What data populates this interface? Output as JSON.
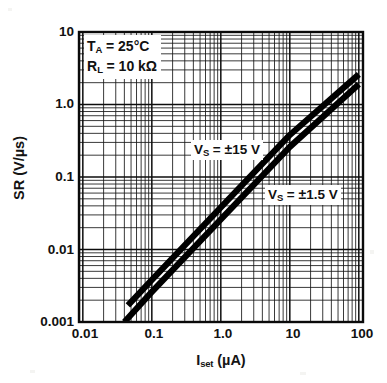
{
  "chart_data": {
    "type": "line",
    "title": "",
    "xlabel": "I_set (µA)",
    "ylabel": "SR (V/µs)",
    "xscale": "log",
    "yscale": "log",
    "xlim": [
      0.0088,
      115
    ],
    "ylim": [
      0.001,
      10
    ],
    "grid": true,
    "minor_grid": true,
    "legend_position": "inline-annotations",
    "x_ticks": [
      "0.01",
      "0.1",
      "1.0",
      "10",
      "100"
    ],
    "x_tick_values": [
      0.01,
      0.1,
      1.0,
      10,
      100
    ],
    "y_ticks": [
      "10",
      "1.0",
      "0.1",
      "0.01",
      "0.001"
    ],
    "y_tick_values": [
      10,
      1.0,
      0.1,
      0.01,
      0.001
    ],
    "series": [
      {
        "name": "VS = ±15 V",
        "x": [
          0.045,
          0.1,
          1.0,
          10,
          100
        ],
        "y": [
          0.0017,
          0.0038,
          0.038,
          0.38,
          2.6
        ]
      },
      {
        "name": "VS = ±1.5 V",
        "x": [
          0.04,
          0.1,
          1.0,
          10,
          100
        ],
        "y": [
          0.001,
          0.0026,
          0.026,
          0.26,
          1.9
        ]
      }
    ],
    "annotations": [
      "T_A = 25°C",
      "R_L = 10 kΩ",
      "V_S = ±15 V",
      "V_S = ±1.5 V"
    ]
  },
  "axes": {
    "y_title_main": "SR (V/",
    "y_title_unit": "µs)",
    "x_title_symbol": "I",
    "x_title_subscript": "set",
    "x_title_unit": " (µA)",
    "y_tick_labels": [
      "10",
      "1.0",
      "0.1",
      "0.01",
      "0.001"
    ],
    "x_tick_labels": [
      "0.01",
      "0.1",
      "1.0",
      "10",
      "100"
    ]
  },
  "conditions": {
    "temp_symbol": "T",
    "temp_subscript": "A",
    "temp_value": " = 25°C",
    "load_symbol": "R",
    "load_subscript": "L",
    "load_value": " = 10 kΩ"
  },
  "curve_labels": {
    "high": {
      "symbol": "V",
      "subscript": "S",
      "value": " = ",
      "pm": "±",
      "level": "15 V"
    },
    "low": {
      "symbol": "V",
      "subscript": "S",
      "value": " = ",
      "pm": "±",
      "level": "1.5 V"
    }
  },
  "colors": {
    "background": "#ffffff",
    "axis": "#141414",
    "grid": "#1a1a1a",
    "curve": "#000000",
    "text": "#111111"
  }
}
